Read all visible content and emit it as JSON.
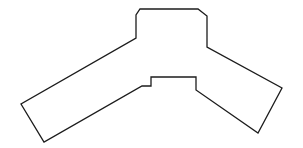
{
  "canvas": {
    "width": 303,
    "height": 148,
    "background": "#ffffff"
  },
  "figure": {
    "type": "polygon-outline",
    "stroke_color": "#1c1c1c",
    "stroke_width": 1.3,
    "fill": "none",
    "points": [
      [
        140,
        9
      ],
      [
        198,
        9
      ],
      [
        207,
        16
      ],
      [
        207,
        47
      ],
      [
        282,
        88
      ],
      [
        258,
        133
      ],
      [
        196,
        90
      ],
      [
        196,
        77
      ],
      [
        151,
        77
      ],
      [
        151,
        86
      ],
      [
        142,
        86
      ],
      [
        44,
        142
      ],
      [
        21,
        104
      ],
      [
        136,
        38
      ],
      [
        136,
        15
      ]
    ]
  }
}
